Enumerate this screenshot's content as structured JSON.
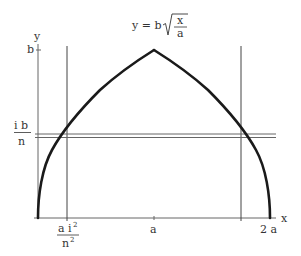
{
  "diagram": {
    "type": "diagram",
    "formula": {
      "lhs": "y = b",
      "radical_numerator": "x",
      "radical_denominator": "a"
    },
    "axes": {
      "x_label": "x",
      "y_label": "y",
      "x_ticks": [
        {
          "label": "a",
          "position": "a"
        },
        {
          "label": "2 a",
          "position": "2a"
        }
      ],
      "y_ticks": [
        {
          "label": "b",
          "position": "b"
        }
      ]
    },
    "annotations": {
      "y_strip_label": {
        "numerator": "i b",
        "denominator": "n"
      },
      "x_line_label": {
        "numerator": "a i",
        "numerator_sup": "2",
        "denominator": "n",
        "denominator_sup": "2"
      }
    },
    "elements": [
      "y-axis",
      "x-axis",
      "curve: left branch from (0,0) rising to peak (a,b)",
      "curve: right branch from peak (a,b) falling to (2a,0)",
      "vertical line at x = a i^2/n^2",
      "vertical line at mirrored position 2a - a i^2/n^2",
      "thin horizontal strip (two parallel lines) at y = i b / n"
    ],
    "colors": {
      "curve": "#1a1a1a",
      "lines": "#555555",
      "text": "#333333",
      "background": "#ffffff"
    }
  }
}
